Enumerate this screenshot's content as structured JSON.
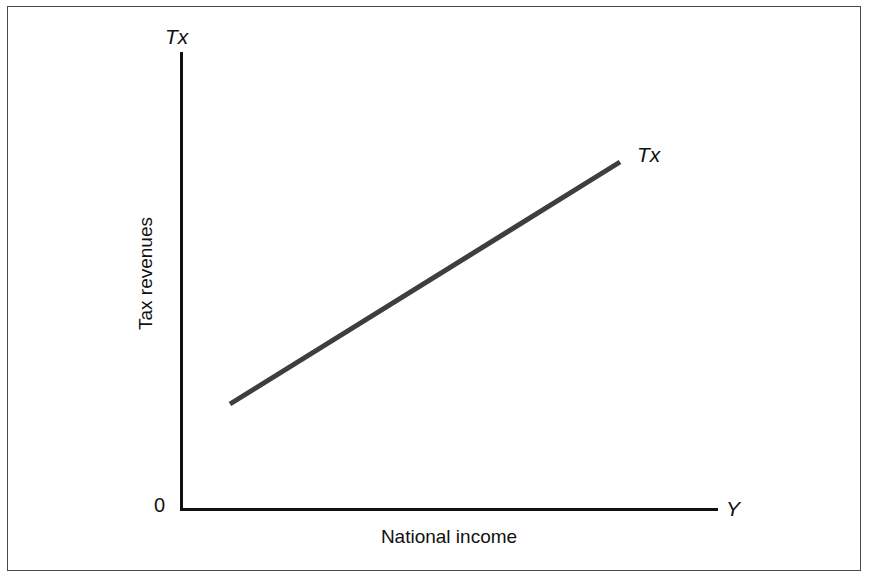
{
  "figure": {
    "background_color": "#ffffff",
    "frame_color": "#4a4a4a"
  },
  "axes": {
    "y_symbol": "Tx",
    "x_symbol": "Y",
    "origin_label": "0",
    "x_title": "National income",
    "y_title": "Tax revenues",
    "axis_color": "#111111"
  },
  "series": {
    "label": "Tx",
    "color": "#3e3e3e",
    "width_px": 5
  },
  "chart_data": {
    "type": "line",
    "title": "",
    "subtitle": "",
    "xlabel": "National income",
    "ylabel": "Tax revenues",
    "x_axis_symbol": "Y",
    "y_axis_symbol": "Tx",
    "origin_label": "0",
    "grid": false,
    "legend": false,
    "legend_position": "line-end-annotation",
    "axis_ticks": [],
    "xlim": [
      0,
      1
    ],
    "ylim": [
      0,
      1
    ],
    "annotations": [
      {
        "text": "Tx",
        "x": 0.85,
        "y": 0.76,
        "style": "italic",
        "note": "label at upper-right end of tax line"
      },
      {
        "text": "Tx",
        "x": 0.0,
        "y": 1.0,
        "style": "italic",
        "note": "y-axis variable symbol"
      },
      {
        "text": "Y",
        "x": 1.0,
        "y": 0.0,
        "style": "italic",
        "note": "x-axis variable symbol"
      },
      {
        "text": "0",
        "x": 0.0,
        "y": 0.0,
        "style": "normal",
        "note": "origin"
      }
    ],
    "series": [
      {
        "name": "Tx",
        "type": "line",
        "color": "#3e3e3e",
        "linewidth": 5,
        "x": [
          0.093,
          0.818
        ],
        "y": [
          0.227,
          0.757
        ],
        "points_px": [
          {
            "x": 230,
            "y": 404
          },
          {
            "x": 620,
            "y": 162
          }
        ],
        "description": "Upward-sloping straight tax revenue function: tax revenues rise linearly with national income"
      }
    ]
  }
}
